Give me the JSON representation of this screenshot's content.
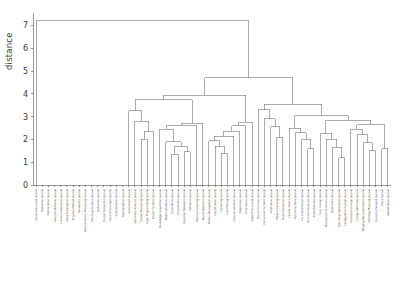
{
  "axis": {
    "ylabel": "distance",
    "yticks": [
      0,
      1,
      2,
      3,
      4,
      5,
      6,
      7
    ],
    "ylim": [
      0,
      7.55
    ]
  },
  "style": {
    "line_color": "#808080",
    "axis_color": "#6e6e6e",
    "tick_text_color": "#3a3a3a",
    "leaf_text_color": "#4a4a4a",
    "background": "#ffffff"
  },
  "chart_data": {
    "type": "line",
    "title": "",
    "xlabel": "",
    "ylabel": "distance",
    "ylim": [
      0,
      7.55
    ],
    "grid": false,
    "legend": null,
    "plot_kind": "dendrogram",
    "orientation": "top",
    "n_leaves": 58,
    "root_height": 7.2,
    "leaf_labels": [
      "Constraint-based Journal",
      "Reduction Journal",
      "Optimization Journal",
      "Heuristic Methods Journal",
      "Function Allocation Journal",
      "Using Formulation Journal",
      "Property Method Journal",
      "Parametric Journal",
      "Nonmonotonic Reasoning Journal",
      "Planning Systems Journal",
      "Abduction Journal",
      "Formal Semantics Journal",
      "Description Logic Journal",
      "Simplification Journal",
      "Reformulation Journal",
      "Abstraction Journal",
      "Sensitivity Analysis Journal",
      "Spatial Reasoning Journal",
      "Logic Programming Journal",
      "Expert Systems Journal",
      "Knowledge Acquisition Journal",
      "Model Validation Journal",
      "Uncertainty Journal",
      "Probabilistic Journal",
      "Bayesian Networks Journal",
      "Inference Journal",
      "Machine Learning Journal",
      "Neural Networks Journal",
      "Pattern Recognition Journal",
      "Classification Journal",
      "Clustering Journal",
      "Data Mining Journal",
      "Feature Selection Journal",
      "Regression Journal",
      "Time Series Journal",
      "Signal Processing Journal",
      "Binary Decision Journal",
      "Concurrent Systems Journal",
      "Verification Journal",
      "Model Checking Journal",
      "State Estimation Journal",
      "Control Theory Journal",
      "Hybrid Systems Journal",
      "Port Hamiltonian Journal",
      "Structural Analysis Journal",
      "Finite Element Journal",
      "Truss Design Journal",
      "Mechanism Synthesis Journal",
      "Kinematics Journal",
      "Switching Statements Journal",
      "Configuration Design Journal",
      "Conceptual Design Journal",
      "Design Rationale Journal",
      "Merging Representations Journal",
      "Ontology Mapping Journal",
      "Dynamic Keyword Journal",
      "Extra Journal",
      "Identification Journal"
    ],
    "merges": [
      {
        "height": 7.2,
        "note": "root"
      },
      {
        "height": 4.7,
        "note": "main right subtree"
      },
      {
        "height": 4.25,
        "note": "second level split"
      },
      {
        "height": 3.9,
        "note": "left cluster A"
      },
      {
        "height": 3.75,
        "note": "mid cluster"
      },
      {
        "height": 3.4,
        "note": "mid-right cluster"
      },
      {
        "height": 3.25,
        "note": "right branch"
      },
      {
        "height": 3.05,
        "note": "cluster A inner"
      },
      {
        "height": 2.95,
        "note": "cluster B"
      },
      {
        "height": 2.85,
        "note": "cluster C"
      },
      {
        "height": 2.8,
        "note": "cluster D"
      },
      {
        "height": 2.75,
        "note": "cluster E"
      },
      {
        "height": 2.7,
        "note": "cluster F"
      },
      {
        "height": 2.6,
        "note": "cluster G"
      },
      {
        "height": 2.55,
        "note": "cluster H"
      },
      {
        "height": 2.45,
        "note": "cluster I"
      },
      {
        "height": 2.35,
        "note": "cluster J"
      },
      {
        "height": 2.3,
        "note": "cluster K"
      },
      {
        "height": 2.2,
        "note": "cluster L"
      },
      {
        "height": 2.1,
        "note": "cluster M"
      },
      {
        "height": 2.0,
        "note": "cluster N"
      },
      {
        "height": 1.9,
        "note": "cluster O"
      },
      {
        "height": 1.8,
        "note": "cluster P"
      },
      {
        "height": 1.7,
        "note": "cluster Q"
      },
      {
        "height": 1.6,
        "note": "cluster R"
      },
      {
        "height": 1.5,
        "note": "cluster S"
      },
      {
        "height": 1.45,
        "note": "cluster T"
      },
      {
        "height": 1.35,
        "note": "cluster U"
      },
      {
        "height": 1.0,
        "note": "lowest merge"
      }
    ]
  }
}
